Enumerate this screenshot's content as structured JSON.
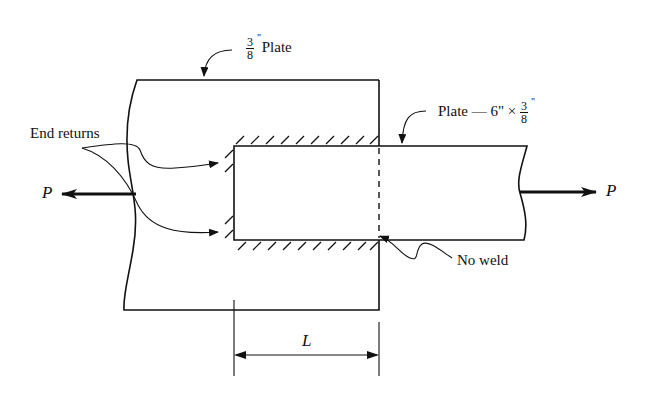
{
  "labels": {
    "top_plate": {
      "fraction_num": "3",
      "fraction_den": "8",
      "inch_mark": "\"",
      "text": "Plate"
    },
    "side_plate": {
      "text": "Plate — 6\" ×",
      "fraction_num": "3",
      "fraction_den": "8",
      "inch_mark": "\""
    },
    "end_returns": "End returns",
    "load_left": "P",
    "load_right": "P",
    "no_weld": "No weld",
    "dimension": "L"
  },
  "colors": {
    "line": "#111111",
    "background": "#ffffff"
  }
}
